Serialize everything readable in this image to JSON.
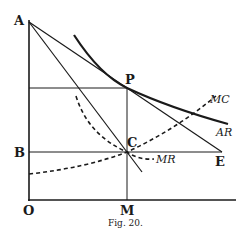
{
  "diagram": {
    "caption": "Fig. 20.",
    "points": {
      "A": "A",
      "B": "B",
      "O": "O",
      "M": "M",
      "P": "P",
      "C": "C",
      "E": "E"
    },
    "curves": {
      "MC": "MC",
      "AR": "AR",
      "MR": "MR"
    },
    "colors": {
      "ink": "#1a1a1a",
      "background": "#ffffff"
    }
  }
}
